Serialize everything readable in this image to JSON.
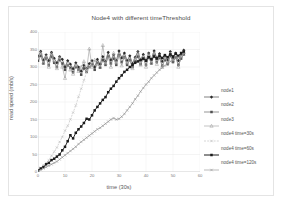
{
  "chart_data": {
    "type": "line",
    "title": "Node4 with different timeThreshold",
    "xlabel": "time (30s)",
    "ylabel": "read speed (mb/s)",
    "xlim": [
      0,
      60
    ],
    "ylim": [
      0,
      400
    ],
    "xticks": [
      0,
      10,
      20,
      30,
      40,
      50,
      60
    ],
    "yticks": [
      0,
      50,
      100,
      150,
      200,
      250,
      300,
      350,
      400
    ],
    "grid": true,
    "legend_position": "right",
    "series": [
      {
        "name": "node1",
        "color": "#2b2b2b",
        "marker": "diamond",
        "style": "solid",
        "x": [
          0,
          1,
          2,
          3,
          4,
          5,
          6,
          7,
          8,
          9,
          10,
          11,
          12,
          13,
          14,
          15,
          16,
          17,
          18,
          19,
          20,
          21,
          22,
          23,
          24,
          25,
          26,
          27,
          28,
          29,
          30,
          31,
          32,
          33,
          34,
          35,
          36,
          37,
          38,
          39,
          40,
          41,
          42,
          43,
          44,
          45,
          46,
          47,
          48,
          49,
          50,
          51,
          52,
          53,
          54
        ],
        "values": [
          330,
          345,
          320,
          335,
          318,
          342,
          325,
          312,
          330,
          322,
          300,
          318,
          308,
          295,
          312,
          300,
          288,
          305,
          296,
          310,
          318,
          300,
          322,
          308,
          330,
          316,
          342,
          320,
          335,
          318,
          346,
          326,
          340,
          318,
          332,
          310,
          328,
          344,
          320,
          336,
          318,
          340,
          322,
          346,
          326,
          338,
          316,
          332,
          320,
          344,
          326,
          340,
          318,
          336,
          348
        ]
      },
      {
        "name": "node2",
        "color": "#4f4f4f",
        "marker": "square",
        "style": "solid",
        "x": [
          0,
          1,
          2,
          3,
          4,
          5,
          6,
          7,
          8,
          9,
          10,
          11,
          12,
          13,
          14,
          15,
          16,
          17,
          18,
          19,
          20,
          21,
          22,
          23,
          24,
          25,
          26,
          27,
          28,
          29,
          30,
          31,
          32,
          33,
          34,
          35,
          36,
          37,
          38,
          39,
          40,
          41,
          42,
          43,
          44,
          45,
          46,
          47,
          48,
          49,
          50,
          51,
          52,
          53,
          54
        ],
        "values": [
          318,
          332,
          310,
          325,
          305,
          330,
          312,
          300,
          320,
          310,
          292,
          305,
          298,
          285,
          300,
          292,
          278,
          296,
          286,
          300,
          308,
          292,
          312,
          298,
          320,
          306,
          330,
          310,
          324,
          306,
          334,
          314,
          328,
          306,
          320,
          300,
          316,
          330,
          308,
          324,
          306,
          328,
          310,
          334,
          314,
          326,
          304,
          320,
          308,
          332,
          314,
          328,
          306,
          324,
          336
        ]
      },
      {
        "name": "node3",
        "color": "#9a9a9a",
        "marker": "triangle",
        "style": "solid",
        "x": [
          0,
          1,
          2,
          3,
          4,
          5,
          6,
          7,
          8,
          9,
          10,
          11,
          12,
          13,
          14,
          15,
          16,
          17,
          18,
          19,
          20,
          21,
          22,
          23,
          24,
          25,
          26,
          27,
          28,
          29,
          30,
          31,
          32,
          33,
          34,
          35,
          36,
          37,
          38,
          39,
          40,
          41,
          42,
          43,
          44,
          45,
          46,
          47,
          48,
          49,
          50,
          51,
          52,
          53,
          54
        ],
        "values": [
          325,
          340,
          312,
          330,
          300,
          338,
          318,
          296,
          328,
          300,
          268,
          310,
          292,
          280,
          305,
          288,
          300,
          316,
          292,
          352,
          300,
          320,
          308,
          300,
          362,
          310,
          330,
          300,
          340,
          312,
          336,
          304,
          330,
          312,
          320,
          296,
          324,
          340,
          306,
          330,
          300,
          336,
          312,
          340,
          308,
          332,
          300,
          326,
          312,
          338,
          318,
          332,
          300,
          330,
          342
        ]
      },
      {
        "name": "node4 time=30s",
        "color": "#b9b9b9",
        "marker": "cross",
        "style": "dashed",
        "x": [
          0,
          1,
          2,
          3,
          4,
          5,
          6,
          7,
          8,
          9,
          10,
          11,
          12,
          13,
          14,
          15,
          16,
          17,
          18,
          19,
          20
        ],
        "values": [
          5,
          12,
          20,
          26,
          34,
          46,
          58,
          70,
          86,
          100,
          118,
          132,
          150,
          170,
          190,
          215,
          238,
          262,
          285,
          300,
          312
        ]
      },
      {
        "name": "node4 time=60s",
        "color": "#1c1c1c",
        "marker": "square",
        "style": "solid",
        "x": [
          0,
          1,
          2,
          3,
          4,
          5,
          6,
          7,
          8,
          9,
          10,
          11,
          12,
          13,
          14,
          15,
          16,
          17,
          18,
          19,
          20,
          21,
          22,
          23,
          24,
          25,
          26,
          27,
          28,
          29,
          30,
          31,
          32,
          33,
          34,
          35,
          36,
          37,
          38,
          39,
          40,
          41,
          42,
          43,
          44,
          45,
          46,
          47,
          48,
          49,
          50,
          51,
          52,
          53,
          54
        ],
        "values": [
          4,
          10,
          14,
          22,
          26,
          34,
          38,
          44,
          50,
          62,
          72,
          88,
          105,
          96,
          112,
          122,
          130,
          140,
          152,
          150,
          162,
          176,
          186,
          196,
          206,
          214,
          228,
          238,
          246,
          258,
          268,
          276,
          286,
          292,
          300,
          306,
          312,
          316,
          320,
          324,
          318,
          328,
          322,
          330,
          324,
          332,
          326,
          334,
          328,
          336,
          330,
          338,
          332,
          340,
          344
        ]
      },
      {
        "name": "node4 time=120s",
        "color": "#8d8d8d",
        "marker": "cross",
        "style": "solid",
        "x": [
          0,
          1,
          2,
          3,
          4,
          5,
          6,
          7,
          8,
          9,
          10,
          11,
          12,
          13,
          14,
          15,
          16,
          17,
          18,
          19,
          20,
          21,
          22,
          23,
          24,
          25,
          26,
          27,
          28,
          29,
          30,
          31,
          32,
          33,
          34,
          35,
          36,
          37,
          38,
          39,
          40,
          41,
          42,
          43,
          44,
          45,
          46,
          47,
          48,
          49,
          50,
          51,
          52,
          53,
          54
        ],
        "values": [
          2,
          6,
          10,
          14,
          18,
          22,
          26,
          30,
          36,
          42,
          48,
          54,
          60,
          66,
          72,
          80,
          86,
          92,
          98,
          104,
          110,
          116,
          122,
          126,
          132,
          138,
          144,
          150,
          154,
          150,
          152,
          158,
          166,
          176,
          186,
          196,
          208,
          218,
          230,
          240,
          250,
          258,
          268,
          276,
          284,
          292,
          298,
          304,
          310,
          316,
          320,
          324,
          328,
          332,
          336
        ]
      }
    ]
  }
}
